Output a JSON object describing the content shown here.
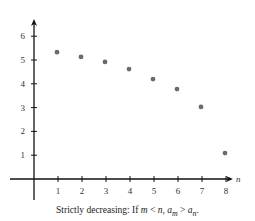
{
  "chart_data": {
    "type": "scatter",
    "title": "",
    "xlabel": "n",
    "ylabel": "",
    "x": [
      1,
      2,
      3,
      4,
      5,
      6,
      7,
      8
    ],
    "values": [
      5.33,
      5.13,
      4.92,
      4.62,
      4.2,
      3.78,
      3.03,
      1.09
    ],
    "xticks": [
      1,
      2,
      3,
      4,
      5,
      6,
      7,
      8
    ],
    "yticks": [
      1,
      2,
      3,
      4,
      5,
      6
    ],
    "xlim": [
      -0.5,
      8.4
    ],
    "ylim": [
      -0.8,
      6.8
    ],
    "grid": false,
    "legend": null,
    "point_color": "#6b6b6b",
    "axis_color": "#111111",
    "annotation": "Strictly decreasing: If m < n, a_m > a_n."
  },
  "caption": {
    "prefix": "Strictly decreasing:  If ",
    "m": "m",
    "lt": " < ",
    "n": "n",
    "comma": ", ",
    "a": "a",
    "sub_m": "m",
    "gt": " > ",
    "a2": "a",
    "sub_n": "n",
    "end": "."
  }
}
